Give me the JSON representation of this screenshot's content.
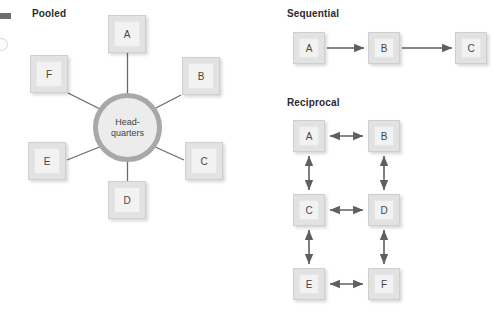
{
  "figure": {
    "margin_marks": {
      "bullet": "margin-bullet-square",
      "circle": "margin-circle-mark"
    },
    "sections": {
      "pooled": {
        "heading": "Pooled",
        "hub": {
          "line1": "Head-",
          "line2": "quarters"
        },
        "nodes": [
          {
            "label": "A"
          },
          {
            "label": "B"
          },
          {
            "label": "C"
          },
          {
            "label": "D"
          },
          {
            "label": "E"
          },
          {
            "label": "F"
          }
        ]
      },
      "sequential": {
        "heading": "Sequential",
        "nodes": [
          {
            "label": "A"
          },
          {
            "label": "B"
          },
          {
            "label": "C"
          }
        ]
      },
      "reciprocal": {
        "heading": "Reciprocal",
        "nodes": [
          {
            "label": "A"
          },
          {
            "label": "B"
          },
          {
            "label": "C"
          },
          {
            "label": "D"
          },
          {
            "label": "E"
          },
          {
            "label": "F"
          }
        ]
      }
    },
    "colors": {
      "node_fill": "#f2f2f2",
      "node_border": "#cfcfcf",
      "hub_ring": "#a8a8a8",
      "hub_fill": "#ececec",
      "connector": "#6b6b6b",
      "heading_text": "#2b2b2b",
      "background": "#ffffff"
    }
  }
}
